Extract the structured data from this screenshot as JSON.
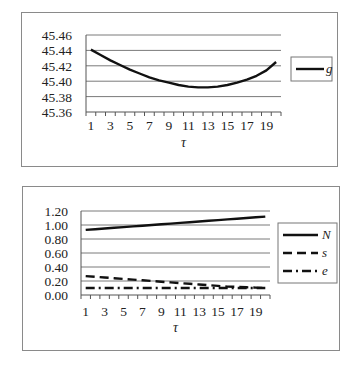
{
  "chart_data": [
    {
      "type": "line",
      "title": "",
      "xlabel": "τ",
      "ylabel": "",
      "x": [
        1,
        2,
        3,
        4,
        5,
        6,
        7,
        8,
        9,
        10,
        11,
        12,
        13,
        14,
        15,
        16,
        17,
        18,
        19,
        20
      ],
      "x_tick_labels": [
        "1",
        "3",
        "5",
        "7",
        "9",
        "11",
        "13",
        "15",
        "17",
        "19"
      ],
      "y_tick_labels": [
        "45.46",
        "45.44",
        "45.42",
        "45.40",
        "45.38",
        "45.36"
      ],
      "ylim": [
        45.36,
        45.46
      ],
      "yticks": [
        45.36,
        45.38,
        45.4,
        45.42,
        45.44,
        45.46
      ],
      "grid": true,
      "legend_position": "right",
      "series": [
        {
          "name": "g",
          "style": "solid",
          "color": "#111111",
          "values": [
            45.441,
            45.434,
            45.427,
            45.421,
            45.415,
            45.41,
            45.405,
            45.401,
            45.398,
            45.395,
            45.393,
            45.392,
            45.392,
            45.393,
            45.395,
            45.398,
            45.402,
            45.407,
            45.414,
            45.425
          ]
        }
      ]
    },
    {
      "type": "line",
      "title": "",
      "xlabel": "τ",
      "ylabel": "",
      "x": [
        1,
        2,
        3,
        4,
        5,
        6,
        7,
        8,
        9,
        10,
        11,
        12,
        13,
        14,
        15,
        16,
        17,
        18,
        19,
        20
      ],
      "x_tick_labels": [
        "1",
        "3",
        "5",
        "7",
        "9",
        "11",
        "13",
        "15",
        "17",
        "19"
      ],
      "y_tick_labels": [
        "1.20",
        "1.00",
        "0.80",
        "0.60",
        "0.40",
        "0.20",
        "0.00"
      ],
      "ylim": [
        0.0,
        1.2
      ],
      "yticks": [
        0.0,
        0.2,
        0.4,
        0.6,
        0.8,
        1.0,
        1.2
      ],
      "grid": true,
      "legend_position": "right",
      "series": [
        {
          "name": "N",
          "style": "solid",
          "color": "#111111",
          "values": [
            0.93,
            0.94,
            0.95,
            0.96,
            0.97,
            0.98,
            0.99,
            1.0,
            1.01,
            1.02,
            1.03,
            1.04,
            1.05,
            1.06,
            1.07,
            1.08,
            1.09,
            1.1,
            1.11,
            1.12
          ]
        },
        {
          "name": "s",
          "style": "dashed",
          "color": "#111111",
          "values": [
            0.27,
            0.26,
            0.25,
            0.24,
            0.23,
            0.22,
            0.21,
            0.2,
            0.19,
            0.18,
            0.17,
            0.16,
            0.15,
            0.14,
            0.13,
            0.12,
            0.115,
            0.11,
            0.105,
            0.1
          ]
        },
        {
          "name": "e",
          "style": "dash-dot",
          "color": "#111111",
          "values": [
            0.1,
            0.1,
            0.1,
            0.1,
            0.1,
            0.1,
            0.1,
            0.1,
            0.1,
            0.1,
            0.1,
            0.1,
            0.1,
            0.1,
            0.1,
            0.1,
            0.1,
            0.1,
            0.1,
            0.1
          ]
        }
      ]
    }
  ]
}
